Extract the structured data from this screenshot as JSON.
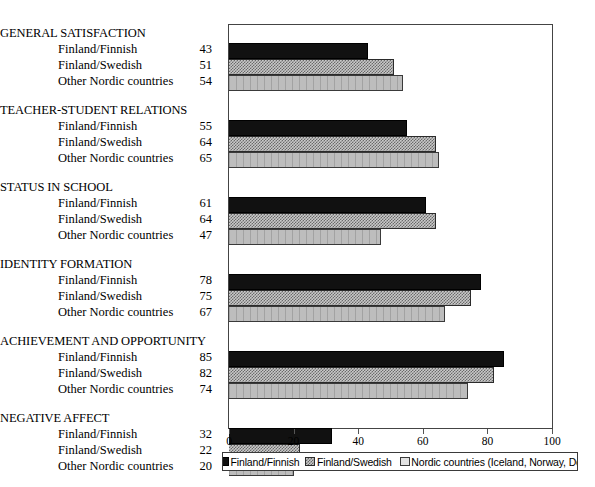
{
  "chart_data": {
    "type": "bar",
    "orientation": "horizontal",
    "title": "",
    "xlabel": "",
    "ylabel": "",
    "xlim": [
      0,
      100
    ],
    "grid": false,
    "legend_position": "bottom",
    "categories": [
      "GENERAL SATISFACTION",
      "TEACHER-STUDENT RELATIONS",
      "STATUS IN SCHOOL",
      "IDENTITY FORMATION",
      "ACHIEVEMENT AND OPPORTUNITY",
      "NEGATIVE AFFECT"
    ],
    "series": [
      {
        "name": "Finland/Finnish",
        "legend": "Finland/Finnish",
        "color": "#111111",
        "fill": "solid-black",
        "values": [
          43,
          55,
          61,
          78,
          85,
          32
        ]
      },
      {
        "name": "Finland/Swedish",
        "legend": "Finland/Swedish",
        "color": "#6a6a6a",
        "fill": "checkered-gray",
        "values": [
          51,
          64,
          64,
          75,
          82,
          22
        ]
      },
      {
        "name": "Other Nordic countries",
        "legend": "Nordic countries (Iceland, Norway, Denmark)",
        "color": "#bdbdbd",
        "fill": "light-gray-vertical-lines",
        "values": [
          54,
          65,
          47,
          67,
          74,
          20
        ]
      }
    ],
    "xticks": [
      0,
      20,
      40,
      60,
      80,
      100
    ],
    "xtick_labels": [
      "0",
      "20",
      "40",
      "60",
      "80",
      "100"
    ]
  },
  "groups": [
    {
      "title": "GENERAL SATISFACTION",
      "rows": [
        {
          "label": "Finland/Finnish",
          "value": "43"
        },
        {
          "label": "Finland/Swedish",
          "value": "51"
        },
        {
          "label": "Other Nordic countries",
          "value": "54"
        }
      ]
    },
    {
      "title": "TEACHER-STUDENT RELATIONS",
      "rows": [
        {
          "label": "Finland/Finnish",
          "value": "55"
        },
        {
          "label": "Finland/Swedish",
          "value": "64"
        },
        {
          "label": "Other Nordic countries",
          "value": "65"
        }
      ]
    },
    {
      "title": "STATUS IN SCHOOL",
      "rows": [
        {
          "label": "Finland/Finnish",
          "value": "61"
        },
        {
          "label": "Finland/Swedish",
          "value": "64"
        },
        {
          "label": "Other Nordic countries",
          "value": "47"
        }
      ]
    },
    {
      "title": "IDENTITY FORMATION",
      "rows": [
        {
          "label": "Finland/Finnish",
          "value": "78"
        },
        {
          "label": "Finland/Swedish",
          "value": "75"
        },
        {
          "label": "Other Nordic countries",
          "value": "67"
        }
      ]
    },
    {
      "title": "ACHIEVEMENT AND OPPORTUNITY",
      "rows": [
        {
          "label": "Finland/Finnish",
          "value": "85"
        },
        {
          "label": "Finland/Swedish",
          "value": "82"
        },
        {
          "label": "Other Nordic countries",
          "value": "74"
        }
      ]
    },
    {
      "title": "NEGATIVE AFFECT",
      "rows": [
        {
          "label": "Finland/Finnish",
          "value": "32"
        },
        {
          "label": "Finland/Swedish",
          "value": "22"
        },
        {
          "label": "Other Nordic countries",
          "value": "20"
        }
      ]
    }
  ],
  "legend": {
    "items": [
      {
        "label": "Finland/Finnish"
      },
      {
        "label": "Finland/Swedish"
      },
      {
        "label": "Nordic countries (Iceland, Norway, Denmark)"
      }
    ]
  }
}
